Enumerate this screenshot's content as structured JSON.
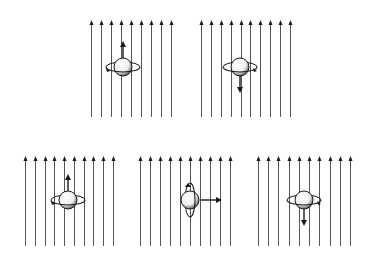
{
  "figure": {
    "colors": {
      "ink": "#1a1a1a",
      "field_line": "#555555",
      "sphere_fill": "#f2f2f2",
      "shade": "#333333"
    },
    "panels": [
      {
        "id": "top-left",
        "x0": 91,
        "x1": 171,
        "lines": 9,
        "top": 20,
        "bottom": 117,
        "cx": 123,
        "cy": 67,
        "ring": "horizontal",
        "arrow": "up",
        "arrow_dir_label": "up"
      },
      {
        "id": "top-right",
        "x0": 201,
        "x1": 290,
        "lines": 10,
        "top": 20,
        "bottom": 117,
        "cx": 240,
        "cy": 67,
        "ring": "horizontal",
        "arrow": "down",
        "arrow_dir_label": "down"
      },
      {
        "id": "bottom-left",
        "x0": 25,
        "x1": 113,
        "lines": 10,
        "top": 156,
        "bottom": 246,
        "cx": 68,
        "cy": 200,
        "ring": "horizontal",
        "arrow": "up",
        "arrow_dir_label": "up"
      },
      {
        "id": "bottom-middle",
        "x0": 140,
        "x1": 230,
        "lines": 10,
        "top": 156,
        "bottom": 246,
        "cx": 190,
        "cy": 200,
        "ring": "vertical",
        "arrow": "right",
        "arrow_dir_label": "right"
      },
      {
        "id": "bottom-right",
        "x0": 258,
        "x1": 350,
        "lines": 10,
        "top": 156,
        "bottom": 246,
        "cx": 304,
        "cy": 200,
        "ring": "horizontal",
        "arrow": "down",
        "arrow_dir_label": "down"
      }
    ]
  }
}
